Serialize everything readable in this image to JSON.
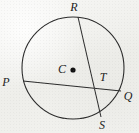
{
  "figure": {
    "name": "circle-with-two-intersecting-chords",
    "background_color": "#f2f2ef",
    "stroke_color": "#2b2b2b",
    "label_color": "#1b1b1b",
    "canvas": {
      "width": 139,
      "height": 133
    }
  },
  "circle": {
    "center_label": "C",
    "center_x": 73,
    "center_y": 68,
    "radius": 51,
    "stroke_width": 1.1
  },
  "center_point": {
    "label": "C",
    "dot_x": 73,
    "dot_y": 70,
    "dot_radius": 2.6,
    "label_x": 61,
    "label_y": 72
  },
  "points": [
    {
      "id": "R",
      "label": "R",
      "x": 78,
      "y": 17,
      "label_x": 74,
      "label_y": 11
    },
    {
      "id": "P",
      "label": "P",
      "x": 23,
      "y": 81,
      "label_x": 4,
      "label_y": 85
    },
    {
      "id": "T",
      "label": "T",
      "x": 95,
      "y": 85,
      "label_x": 99,
      "label_y": 81
    },
    {
      "id": "Q",
      "label": "Q",
      "x": 121,
      "y": 91,
      "label_x": 123,
      "label_y": 99
    },
    {
      "id": "S",
      "label": "S",
      "x": 101,
      "y": 117,
      "label_x": 99,
      "label_y": 128
    }
  ],
  "chords": [
    {
      "id": "RS",
      "name": "chord-r-s",
      "from": "R",
      "to": "S",
      "x1": 78,
      "y1": 17,
      "x2": 101,
      "y2": 117
    },
    {
      "id": "PQ",
      "name": "chord-p-q",
      "from": "P",
      "to": "Q",
      "x1": 23,
      "y1": 81,
      "x2": 121,
      "y2": 91
    }
  ],
  "intersection": {
    "label": "T",
    "x": 95,
    "y": 85
  }
}
